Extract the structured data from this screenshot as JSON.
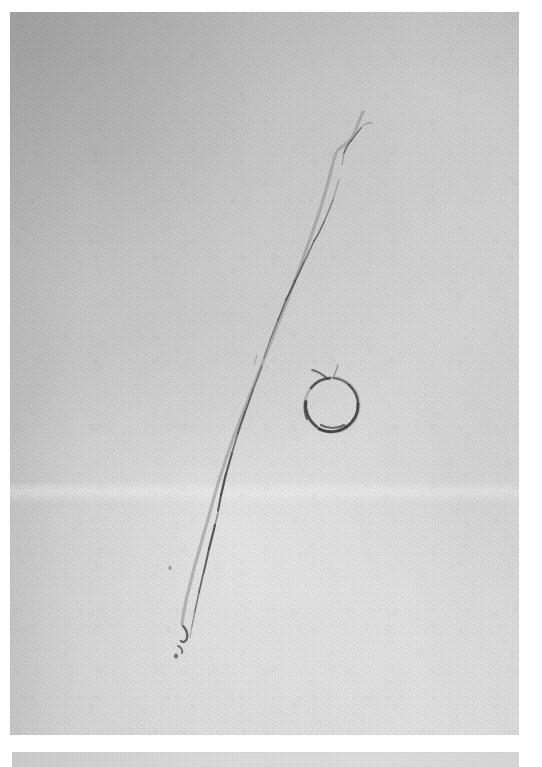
{
  "figure": {
    "domain": "Natural-Image",
    "kind": "grayscale-photograph",
    "caption": "",
    "background_color": "#ffffff",
    "panels": [
      {
        "id": "main-panel",
        "name": "primary photographic plate",
        "x": 10,
        "y": 12,
        "width": 509,
        "height": 723,
        "base_color": "#d6d6d6",
        "tone_range": [
          "#c4c4c4",
          "#eaeaea"
        ],
        "description": "Uniform light gray granular surface, brighter toward the lower-left, darker along the top and left edges."
      },
      {
        "id": "bottom-band",
        "name": "secondary strip",
        "x": 12,
        "y": 752,
        "width": 507,
        "height": 15,
        "base_color": "#d9d9d9",
        "tone_range": [
          "#cccccc",
          "#e6e6e6"
        ],
        "description": "Narrow gray strip separated from the main plate by a white gutter."
      }
    ],
    "features": [
      {
        "id": "crack",
        "name": "diagonal fracture line",
        "color": "#4a4a4a",
        "start": [
          363,
          112
        ],
        "end": [
          178,
          648
        ],
        "length_px": 568,
        "description": "Thin dark irregular crack descending from upper right to lower left, thickest near the middle, faint and broken near both ends."
      },
      {
        "id": "ring",
        "name": "circular ring mark",
        "color": "#3f3f3f",
        "center": [
          332,
          405
        ],
        "radius_x": 27,
        "radius_y": 27,
        "description": "Small open circular outline to the right of the crack, with a short tail flicking up and left from its top."
      },
      {
        "id": "hook-mark",
        "name": "comma hook mark",
        "color": "#3a3a3a",
        "center": [
          182,
          633
        ],
        "description": "Tiny hooked blemish at the lower terminus of the crack."
      },
      {
        "id": "seam-band",
        "name": "light horizontal seam",
        "y": 492,
        "description": "Faint brighter horizontal band crossing the full width of the plate."
      }
    ],
    "colors": {
      "paper": "#ffffff",
      "plate_light": "#e6e6e6",
      "plate_mid": "#d6d6d6",
      "plate_dark": "#c3c3c3",
      "crack": "#4a4a4a",
      "ring": "#3f3f3f"
    }
  }
}
